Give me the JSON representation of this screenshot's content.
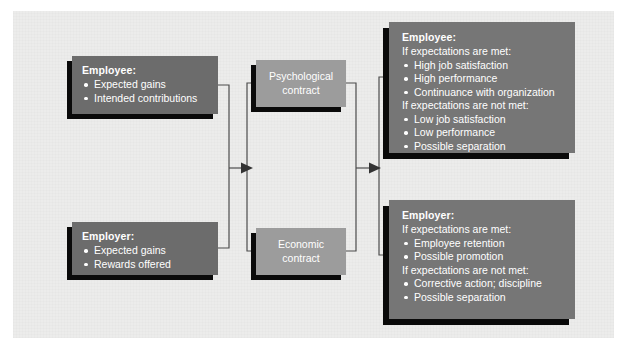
{
  "figure": {
    "canvas_color": "#ececeb",
    "dark_box_color": "#6c6c6c",
    "light_box_color": "#9c9c9c",
    "shadow_color": "#0a0a0a",
    "line_color": "#4d4d4d",
    "text_color": "#ffffff"
  },
  "nodes": {
    "employee_input": {
      "title": "Employee:",
      "bullets": [
        "Expected gains",
        "Intended contributions"
      ]
    },
    "employer_input": {
      "title": "Employer:",
      "bullets": [
        "Expected gains",
        "Rewards offered"
      ]
    },
    "psychological_contract": {
      "line1": "Psychological",
      "line2": "contract"
    },
    "economic_contract": {
      "line1": "Economic",
      "line2": "contract"
    },
    "employee_outcomes": {
      "title": "Employee:",
      "met_label": "If expectations are met:",
      "met_bullets": [
        "High job satisfaction",
        "High performance",
        "Continuance with organization"
      ],
      "not_met_label": "If expectations are not met:",
      "not_met_bullets": [
        "Low job satisfaction",
        "Low performance",
        "Possible separation"
      ]
    },
    "employer_outcomes": {
      "title": "Employer:",
      "met_label": "If expectations are met:",
      "met_bullets": [
        "Employee retention",
        "Possible promotion"
      ],
      "not_met_label": "If expectations are not met:",
      "not_met_bullets": [
        "Corrective action; discipline",
        "Possible separation"
      ]
    }
  }
}
